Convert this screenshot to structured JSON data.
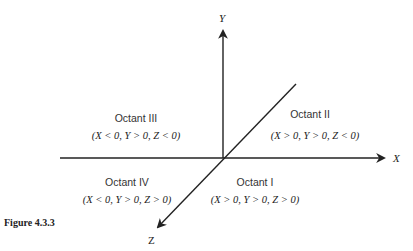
{
  "figure": {
    "caption": "Figure 4.3.3",
    "axes": {
      "x_label": "X",
      "y_label": "Y",
      "z_label": "Z"
    },
    "octants": [
      {
        "name": "Octant III",
        "condition": "(X < 0, Y > 0, Z < 0)",
        "position": "upper-left"
      },
      {
        "name": "Octant II",
        "condition": "(X > 0, Y > 0, Z < 0)",
        "position": "upper-right"
      },
      {
        "name": "Octant IV",
        "condition": "(X < 0, Y > 0, Z > 0)",
        "position": "lower-left"
      },
      {
        "name": "Octant I",
        "condition": "(X > 0, Y > 0, Z > 0)",
        "position": "lower-right"
      }
    ],
    "colors": {
      "axis": "#222222",
      "text": "#333333"
    }
  }
}
